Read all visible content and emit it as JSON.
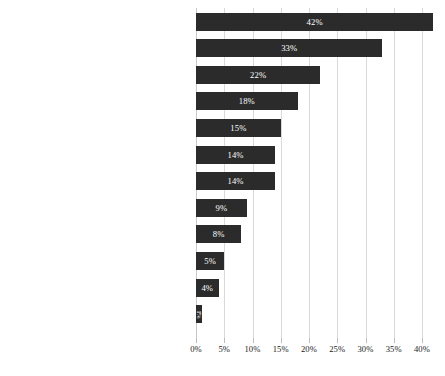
{
  "chart_data": {
    "type": "bar",
    "orientation": "horizontal",
    "title": "",
    "subtitle": "",
    "xlabel": "",
    "ylabel": "",
    "xlim": [
      0,
      40
    ],
    "grid": true,
    "legend": null,
    "value_suffix": "%",
    "xticks": [
      "0%",
      "5%",
      "10%",
      "15%",
      "20%",
      "25%",
      "30%",
      "35%",
      "40%"
    ],
    "xtick_values": [
      0,
      5,
      10,
      15,
      20,
      25,
      30,
      35,
      40
    ],
    "bar_color": "#2b2b2b",
    "value_label_color": "#ffffff",
    "gridline_color": "#d9d9d9",
    "background_color": "#ffffff",
    "categories": [
      "Fashion (clothes, shoes, jewelry, accessories, etc.)",
      "Technical products",
      "Music and books (incl. online/streaming services)",
      "Food",
      "Furniture and home accessories",
      "Travel (accommodation, transport, tickets, etc.)",
      "Leisure items (including games)",
      "Subscription services (TV, Netflix, newspapers)",
      "Beauty and health",
      "Sporting goods",
      "Pet supplies",
      "Gifts"
    ],
    "values": [
      42,
      33,
      22,
      18,
      15,
      14,
      14,
      9,
      8,
      5,
      4,
      1
    ],
    "value_labels": [
      "42%",
      "33%",
      "22%",
      "18%",
      "15%",
      "14%",
      "14%",
      "9%",
      "8%",
      "5%",
      "4%",
      "1%"
    ]
  }
}
